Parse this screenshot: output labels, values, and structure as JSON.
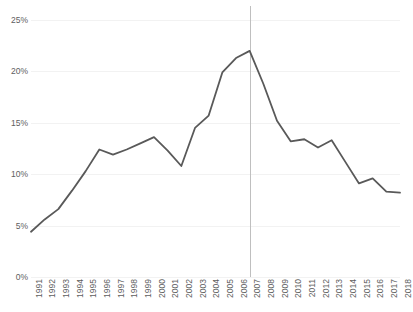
{
  "chart_data": {
    "type": "line",
    "title": "",
    "subtitle": "",
    "xlabel": "",
    "ylabel": "",
    "ylim": [
      0,
      25
    ],
    "ytick_values": [
      0,
      5,
      10,
      15,
      20,
      25
    ],
    "ytick_labels": [
      "0%",
      "5%",
      "10%",
      "15%",
      "20%",
      "25%"
    ],
    "grid": true,
    "legend": "none",
    "line_color": "#595959",
    "gridline_color": "#f2f2f2",
    "marker_line_color": "#bfbfbf",
    "annotations": [
      {
        "name": "vertical-reference-line",
        "x": "2007",
        "label": ""
      }
    ],
    "categories": [
      "1991",
      "1992",
      "1993",
      "1994",
      "1995",
      "1996",
      "1997",
      "1998",
      "1999",
      "2000",
      "2001",
      "2002",
      "2003",
      "2004",
      "2005",
      "2006",
      "2007",
      "2008",
      "2009",
      "2010",
      "2011",
      "2012",
      "2013",
      "2014",
      "2015",
      "2016",
      "2017",
      "2018"
    ],
    "series": [
      {
        "name": "",
        "values": [
          4.4,
          5.6,
          6.6,
          8.4,
          10.3,
          12.4,
          11.9,
          12.4,
          13.0,
          13.6,
          12.3,
          10.8,
          14.5,
          15.7,
          19.9,
          21.3,
          22.0,
          18.8,
          15.2,
          13.2,
          13.4,
          12.6,
          13.3,
          11.2,
          9.1,
          9.6,
          8.3,
          8.2
        ]
      }
    ]
  }
}
